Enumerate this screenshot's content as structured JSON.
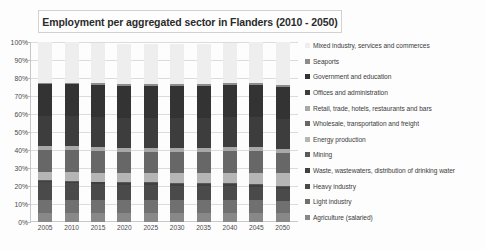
{
  "chart_data": {
    "type": "bar",
    "subtype": "stacked-100-percent-column",
    "title": "Employment per aggregated sector in Flanders (2010 - 2050)",
    "xlabel": "",
    "ylabel": "",
    "ylim": [
      0,
      100
    ],
    "ytick_labels": [
      "100%",
      "90%",
      "80%",
      "70%",
      "60%",
      "50%",
      "40%",
      "30%",
      "20%",
      "10%",
      "0%"
    ],
    "ytick_values": [
      100,
      90,
      80,
      70,
      60,
      50,
      40,
      30,
      20,
      10,
      0
    ],
    "grid": true,
    "legend_position": "right",
    "categories": [
      "2005",
      "2010",
      "2015",
      "2020",
      "2025",
      "2030",
      "2035",
      "2040",
      "2045",
      "2050"
    ],
    "series": [
      {
        "name": "Mixed industry, services and commerces",
        "color": "#eeeeee",
        "values": [
          22.5,
          22.5,
          22.5,
          22.5,
          22.5,
          22.5,
          22.5,
          22.5,
          23.0,
          24.0
        ]
      },
      {
        "name": "Seaports",
        "color": "#8c8c8c",
        "values": [
          1.0,
          1.0,
          1.0,
          1.0,
          1.0,
          1.0,
          1.0,
          1.0,
          1.0,
          1.0
        ]
      },
      {
        "name": "Government and education",
        "color": "#333333",
        "values": [
          17.5,
          17.5,
          17.5,
          17.5,
          17.5,
          17.5,
          17.5,
          17.5,
          17.5,
          17.5
        ]
      },
      {
        "name": "Offices and administration",
        "color": "#3d3d3d",
        "values": [
          17.0,
          17.0,
          17.0,
          17.0,
          17.0,
          17.0,
          17.0,
          17.0,
          17.0,
          17.0
        ]
      },
      {
        "name": "Retail, trade, hotels, restaurants and bars",
        "color": "#a8a8a8",
        "values": [
          2.0,
          2.0,
          2.0,
          2.0,
          2.0,
          2.0,
          2.0,
          2.0,
          2.0,
          2.0
        ]
      },
      {
        "name": "Wholesale, transportation and freight",
        "color": "#676767",
        "values": [
          12.0,
          12.0,
          12.0,
          12.0,
          12.0,
          12.0,
          12.0,
          12.0,
          12.0,
          11.5
        ]
      },
      {
        "name": "Energy production",
        "color": "#b5b5b5",
        "values": [
          4.5,
          5.0,
          5.0,
          5.0,
          5.0,
          5.5,
          5.5,
          6.0,
          6.5,
          7.0
        ]
      },
      {
        "name": "Mining",
        "color": "#5a5a5a",
        "values": [
          0.5,
          0.5,
          0.5,
          0.5,
          0.5,
          0.5,
          0.5,
          0.5,
          0.5,
          0.5
        ]
      },
      {
        "name": "Waste, wastewaters, distribution of drinking water",
        "color": "#404040",
        "values": [
          1.0,
          1.0,
          1.0,
          1.0,
          1.0,
          1.0,
          1.0,
          1.0,
          1.0,
          1.0
        ]
      },
      {
        "name": "Heavy industry",
        "color": "#4a4a4a",
        "values": [
          10.0,
          9.5,
          9.0,
          8.5,
          8.5,
          8.0,
          8.0,
          8.0,
          7.5,
          7.0
        ]
      },
      {
        "name": "Light industry",
        "color": "#707070",
        "values": [
          7.0,
          7.0,
          7.0,
          7.0,
          7.0,
          7.0,
          7.0,
          7.0,
          7.0,
          6.5
        ]
      },
      {
        "name": "Agriculture (salaried)",
        "color": "#888888",
        "values": [
          5.0,
          5.0,
          5.0,
          5.0,
          5.0,
          5.0,
          5.0,
          5.0,
          5.0,
          5.0
        ]
      }
    ]
  }
}
